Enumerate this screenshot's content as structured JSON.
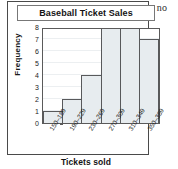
{
  "stray_text": "; no",
  "figure": {
    "title": "Baseball Ticket Sales"
  },
  "chart_data": {
    "type": "bar",
    "title": "Baseball Ticket Sales",
    "xlabel": "Tickets sold",
    "ylabel": "Frequency",
    "categories": [
      "150–189",
      "190–229",
      "230–269",
      "270–309",
      "310–349",
      "350–389"
    ],
    "values": [
      1,
      2,
      4,
      8,
      8,
      7
    ],
    "ylim": [
      0,
      8
    ],
    "yticks": [
      0,
      1,
      2,
      3,
      4,
      5,
      6,
      7,
      8
    ],
    "ytick_labels": [
      "0",
      "1",
      "2",
      "3",
      "4",
      "5",
      "6",
      "7",
      "8"
    ],
    "grid": true,
    "legend": null,
    "bar_fill_color": "#e7ecef",
    "bar_edge_color": "#58595b",
    "axis_color": "#5a5a5a",
    "gridline_color": "#eceff1"
  }
}
